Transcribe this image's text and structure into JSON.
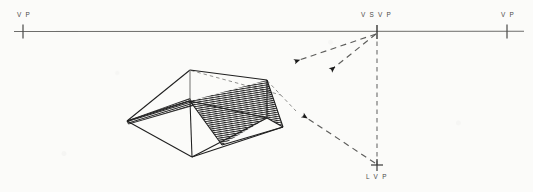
{
  "figure": {
    "kind": "perspective-shadow-construction-diagram",
    "background_color": "#fbfbf9",
    "ink_color": "#2b2b2b",
    "horizon_color": "#6d6d6b",
    "hatch_color": "#1d1d1d"
  },
  "labels": {
    "vp_left": "V P",
    "vsvp": "V S V P",
    "vp_right": "V P",
    "lvp": "L V P"
  },
  "horizon": {
    "label": "horizon-line",
    "y": 31,
    "x_start": 14,
    "x_end": 524
  },
  "points": {
    "vp_left": {
      "x": 23,
      "y": 31,
      "tick_half_height": 7
    },
    "vsvp": {
      "x": 377,
      "y": 32,
      "tick_half_height": 7
    },
    "vp_right": {
      "x": 507,
      "y": 31,
      "tick_half_height": 7
    },
    "lvp": {
      "x": 377,
      "y": 165,
      "tick_half_height": 5,
      "tick_half_width": 5
    }
  },
  "vertical_trace": {
    "name": "vsvp-to-lvp-dashed-line",
    "x": 377,
    "y_top": 33,
    "y_bottom": 166
  },
  "light_rays": [
    {
      "name": "ray-vsvp-upper",
      "from": {
        "x": 377,
        "y": 33
      },
      "to": {
        "x": 293,
        "y": 62
      },
      "style": "dashed",
      "arrow": "end"
    },
    {
      "name": "ray-vsvp-lower",
      "from": {
        "x": 377,
        "y": 33
      },
      "to": {
        "x": 329,
        "y": 71
      },
      "style": "dashed",
      "arrow": "end"
    },
    {
      "name": "ray-lvp-to-object",
      "from": {
        "x": 377,
        "y": 165
      },
      "to": {
        "x": 301,
        "y": 114
      },
      "style": "dashed",
      "arrow": "end"
    }
  ],
  "object": {
    "name": "hipped-roof-prism",
    "vertices": {
      "left": {
        "x": 127,
        "y": 121
      },
      "apex_left": {
        "x": 190,
        "y": 70
      },
      "apex_right": {
        "x": 267,
        "y": 80
      },
      "right": {
        "x": 283,
        "y": 127
      },
      "bottom": {
        "x": 192,
        "y": 157
      },
      "ridge_left": {
        "x": 190,
        "y": 101
      },
      "ridge_right": {
        "x": 267,
        "y": 118
      },
      "eave_mid": {
        "x": 222,
        "y": 145
      }
    },
    "edges": [
      {
        "name": "edge-left-to-apexleft",
        "from": "left",
        "to": "apex_left"
      },
      {
        "name": "edge-apexleft-to-apexright",
        "from": "apex_left",
        "to": "apex_right"
      },
      {
        "name": "edge-apexright-to-right",
        "from": "apex_right",
        "to": "right"
      },
      {
        "name": "edge-left-to-bottom",
        "from": "left",
        "to": "bottom"
      },
      {
        "name": "edge-bottom-to-right",
        "from": "bottom",
        "to": "right"
      },
      {
        "name": "edge-apexleft-ridgeleft",
        "from": "apex_left",
        "to": "ridge_left"
      },
      {
        "name": "edge-apexright-ridgeright",
        "from": "apex_right",
        "to": "ridge_right"
      },
      {
        "name": "edge-left-to-ridgeleft",
        "from": "left",
        "to": "ridge_left"
      },
      {
        "name": "edge-ridgeleft-ridgeright",
        "from": "ridge_left",
        "to": "ridge_right"
      },
      {
        "name": "edge-ridgeright-to-right",
        "from": "ridge_right",
        "to": "right"
      },
      {
        "name": "edge-ridgeleft-to-bottom",
        "from": "ridge_left",
        "to": "bottom"
      },
      {
        "name": "edge-bottom-to-ridgeright",
        "from": "bottom",
        "to": "ridge_right"
      }
    ],
    "shadow_polygon": {
      "name": "cast-shadow-hatched-area",
      "hatching": "horizontal-fine-lines",
      "points": [
        {
          "x": 190,
          "y": 101
        },
        {
          "x": 267,
          "y": 80
        },
        {
          "x": 283,
          "y": 127
        },
        {
          "x": 267,
          "y": 118
        },
        {
          "x": 222,
          "y": 145
        }
      ]
    },
    "shadow_wedge": {
      "name": "left-shadow-wedge",
      "points": [
        {
          "x": 127,
          "y": 121
        },
        {
          "x": 190,
          "y": 99
        },
        {
          "x": 193,
          "y": 105
        },
        {
          "x": 128,
          "y": 124
        }
      ]
    },
    "construction_lines": [
      {
        "name": "construction-apexleft-to-apexright-dashed",
        "from": {
          "x": 190,
          "y": 70
        },
        "to": {
          "x": 280,
          "y": 95
        }
      },
      {
        "name": "construction-apexright-to-right-dashed",
        "from": {
          "x": 267,
          "y": 80
        },
        "to": {
          "x": 295,
          "y": 110
        }
      }
    ]
  }
}
